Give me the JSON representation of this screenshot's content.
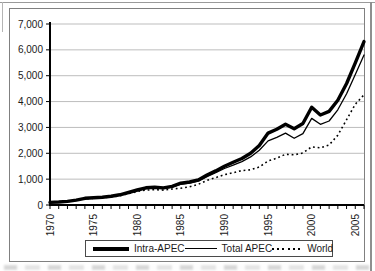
{
  "colors": {
    "axis": "#000000",
    "grid": "#bdbdbd",
    "chart_border": "#808080",
    "frame": "#9a9a9a",
    "text": "#1a1a1a",
    "series_color": "#000000"
  },
  "chart_data": {
    "type": "line",
    "title": "",
    "xlabel": "",
    "ylabel": "",
    "x_range": [
      1970,
      2006
    ],
    "ylim": [
      0,
      7000
    ],
    "grid": "horizontal",
    "legend_position": "bottom",
    "x": [
      1970,
      1971,
      1972,
      1973,
      1974,
      1975,
      1976,
      1977,
      1978,
      1979,
      1980,
      1981,
      1982,
      1983,
      1984,
      1985,
      1986,
      1987,
      1988,
      1989,
      1990,
      1991,
      1992,
      1993,
      1994,
      1995,
      1996,
      1997,
      1998,
      1999,
      2000,
      2001,
      2002,
      2003,
      2004,
      2005,
      2006
    ],
    "series": [
      {
        "name": "Intra-APEC",
        "line_style": "solid-thick",
        "color": "#000000",
        "values": [
          100,
          115,
          140,
          190,
          260,
          280,
          300,
          335,
          395,
          485,
          580,
          665,
          690,
          660,
          720,
          845,
          890,
          970,
          1160,
          1320,
          1500,
          1650,
          1800,
          2000,
          2300,
          2780,
          2930,
          3120,
          2950,
          3150,
          3780,
          3480,
          3620,
          4050,
          4700,
          5500,
          6320
        ]
      },
      {
        "name": "Total APEC",
        "line_style": "solid-thin",
        "color": "#000000",
        "values": [
          100,
          112,
          136,
          185,
          250,
          272,
          292,
          325,
          382,
          468,
          558,
          638,
          660,
          632,
          690,
          808,
          848,
          925,
          1100,
          1250,
          1410,
          1540,
          1680,
          1860,
          2120,
          2480,
          2620,
          2780,
          2580,
          2760,
          3350,
          3120,
          3250,
          3680,
          4300,
          5050,
          5800
        ]
      },
      {
        "name": "World",
        "line_style": "dotted",
        "color": "#000000",
        "values": [
          100,
          110,
          130,
          178,
          242,
          258,
          278,
          308,
          360,
          438,
          522,
          578,
          592,
          578,
          620,
          648,
          702,
          800,
          950,
          1060,
          1170,
          1250,
          1330,
          1360,
          1470,
          1700,
          1810,
          1960,
          1940,
          2010,
          2250,
          2210,
          2320,
          2700,
          3300,
          3900,
          4260
        ]
      }
    ],
    "y_ticks": [
      {
        "v": 0,
        "label": "0"
      },
      {
        "v": 1000,
        "label": "1,000"
      },
      {
        "v": 2000,
        "label": "2,000"
      },
      {
        "v": 3000,
        "label": "3,000"
      },
      {
        "v": 4000,
        "label": "4,000"
      },
      {
        "v": 5000,
        "label": "5,000"
      },
      {
        "v": 6000,
        "label": "6,000"
      },
      {
        "v": 7000,
        "label": "7,000"
      }
    ],
    "x_major_ticks": [
      {
        "v": 1970,
        "label": "1970"
      },
      {
        "v": 1975,
        "label": "1975"
      },
      {
        "v": 1980,
        "label": "1980"
      },
      {
        "v": 1985,
        "label": "1985"
      },
      {
        "v": 1990,
        "label": "1990"
      },
      {
        "v": 1995,
        "label": "1995"
      },
      {
        "v": 2000,
        "label": "2000"
      },
      {
        "v": 2005,
        "label": "2005"
      }
    ]
  }
}
